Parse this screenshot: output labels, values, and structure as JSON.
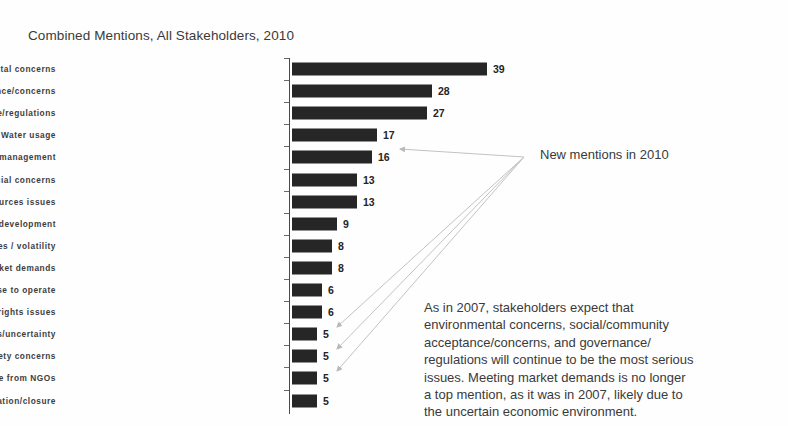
{
  "chart_data": {
    "type": "bar",
    "orientation": "horizontal",
    "title": "Combined Mentions, All Stakeholders, 2010",
    "xlabel": "",
    "ylabel": "",
    "grid": false,
    "legend": "none",
    "xlim": [
      0,
      39
    ],
    "categories": [
      "Environmental concerns",
      "Social/community acceptance/concerns",
      "Governance/regulations",
      "Water usage",
      "Resource access/management",
      "Financial concerns",
      "Human resources issues",
      "Sustainable development",
      "Cost pressures / volatility",
      "Meeting market demands",
      "License to operate",
      "Human rights issues",
      "Economic issues/uncertainty",
      "Health/safety concerns",
      "Role of / pressure from NGOs",
      "Mine rehabilitation/closure"
    ],
    "values": [
      39,
      28,
      27,
      17,
      16,
      13,
      13,
      9,
      8,
      8,
      6,
      6,
      5,
      5,
      5,
      5
    ],
    "bar_color": "#262626",
    "annotations": [
      {
        "text": "New mentions in 2010",
        "targets": [
          "Water usage",
          "Economic issues/uncertainty",
          "Health/safety concerns",
          "Role of / pressure from NGOs"
        ]
      },
      {
        "text": "As in 2007, stakeholders expect that environmental concerns, social/community acceptance/concerns, and governance/ regulations will continue to be the most serious issues. Meeting market demands is no longer a top mention, as it was in 2007, likely due to the uncertain economic environment."
      }
    ]
  },
  "callout": {
    "new_mentions_label": "New mentions in 2010"
  },
  "annotation": {
    "lines": [
      "As in 2007, stakeholders expect that",
      "environmental concerns, social/community",
      "acceptance/concerns, and governance/",
      "regulations will continue to be the most serious",
      "issues. Meeting market demands is no longer",
      "a top mention, as it was in 2007, likely due to",
      "the uncertain economic environment."
    ]
  }
}
